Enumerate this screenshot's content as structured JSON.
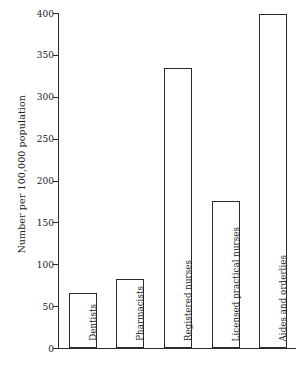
{
  "chart_data": {
    "type": "bar",
    "title": "",
    "xlabel": "",
    "ylabel": "Number per 100,000 population",
    "categories": [
      "Dentists",
      "Pharmacists",
      "Registered nurses",
      "Licensed practical nurses",
      "Aides and orderlies"
    ],
    "values": [
      66,
      83,
      334,
      176,
      399
    ],
    "ylim": [
      0,
      400
    ],
    "ytick_labels": [
      "0",
      "50",
      "100",
      "150",
      "200",
      "250",
      "300",
      "350",
      "400"
    ],
    "ytick_values": [
      0,
      50,
      100,
      150,
      200,
      250,
      300,
      350,
      400
    ],
    "grid": false,
    "legend": null,
    "bar_fill": "#ffffff",
    "bar_stroke": "#2b2b2b",
    "axis_color": "#2b2b2b",
    "background": "#ffffff"
  }
}
